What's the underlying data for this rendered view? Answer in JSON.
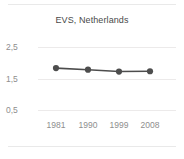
{
  "chart_data": {
    "type": "line",
    "title": "EVS, Netherlands",
    "xlabel": "",
    "ylabel": "",
    "categories": [
      "1981",
      "1990",
      "1999",
      "2008"
    ],
    "x": [
      1981,
      1990,
      1999,
      2008
    ],
    "values": [
      1.83,
      1.78,
      1.72,
      1.73
    ],
    "series": [
      {
        "name": "EVS, Netherlands",
        "values": [
          1.83,
          1.78,
          1.72,
          1.73
        ]
      }
    ],
    "ylim": [
      0.5,
      2.5
    ],
    "yticks": [
      2.5,
      1.5,
      0.5
    ],
    "ytick_labels": [
      "2,5",
      "1,5",
      "0,5"
    ],
    "xtick_labels": [
      "1981",
      "1990",
      "1999",
      "2008"
    ],
    "grid": true,
    "grid_axis": "y",
    "legend": false,
    "legend_position": "none",
    "colors": {
      "line": "#4d4d4d",
      "marker": "#4d4d4d",
      "grid": "#eceaea",
      "tick_label": "#8e8e8e",
      "title": "#4a4a4a",
      "background": "#ffffff",
      "frame_rule": "#e9e9e9"
    },
    "marker": "circle",
    "annotations": []
  },
  "figure": {
    "title": "EVS, Netherlands",
    "ytick_0": "2,5",
    "ytick_1": "1,5",
    "ytick_2": "0,5",
    "xtick_0": "1981",
    "xtick_1": "1990",
    "xtick_2": "1999",
    "xtick_3": "2008"
  }
}
